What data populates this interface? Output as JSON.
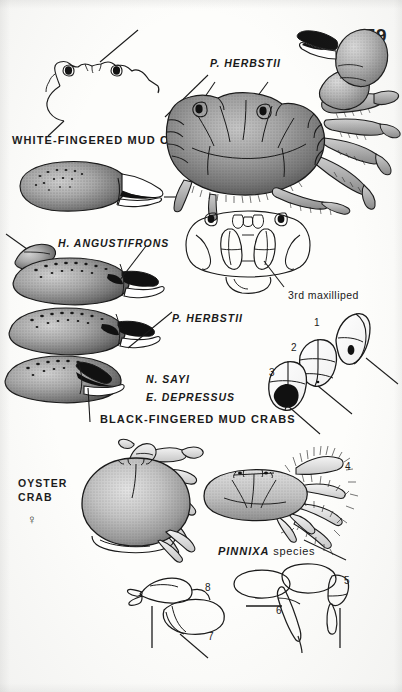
{
  "page": {
    "folio": "59",
    "background_color": "#fdfdfb",
    "ink_color": "#1a1a1a",
    "width": 402,
    "height": 692
  },
  "figures": {
    "white_fingered": {
      "common_name": "WHITE-FINGERED MUD CRAB",
      "parts": [
        "carapace-outline-dorsal",
        "claw-white-fingered"
      ]
    },
    "panopeus_herbstii_habitus": {
      "species_label": "P. HERBSTII",
      "parts": [
        "whole-crab-dorsal-stippled"
      ]
    },
    "maxilliped": {
      "label": "3rd maxilliped",
      "parts": [
        "third-maxilliped-line-drawing"
      ]
    },
    "black_fingered_group": {
      "common_name": "BLACK-FINGERED MUD CRABS",
      "species": [
        {
          "label": "H. ANGUSTIFRONS"
        },
        {
          "label": "P. HERBSTII"
        },
        {
          "label": "N. SAYI"
        },
        {
          "label": "E. DEPRESSUS"
        }
      ]
    },
    "dactyl_series": {
      "callouts": [
        "1",
        "2",
        "3"
      ]
    },
    "oyster_crab": {
      "common_name_line1": "OYSTER",
      "common_name_line2": "CRAB",
      "sex_symbol": "♀"
    },
    "pinnixa": {
      "label_italic": "PINNIXA",
      "label_roman": "species",
      "callouts": [
        "4",
        "5"
      ]
    },
    "leg_details": {
      "callouts": [
        "6",
        "7",
        "8"
      ]
    }
  }
}
